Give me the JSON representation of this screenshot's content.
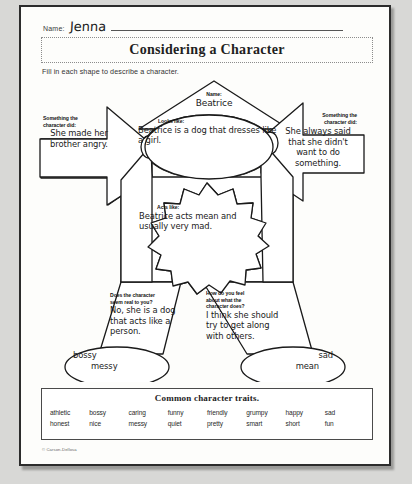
{
  "page": {
    "name_label": "Name:",
    "name_value": "Jenna",
    "title": "Considering a Character",
    "instruction": "Fill in each shape to describe a character.",
    "copyright": "© Carson-Dellosa"
  },
  "organizer": {
    "head": {
      "prompt": "Name:",
      "answer": "Beatrice"
    },
    "face": {
      "prompt": "Looks like:",
      "answer": "Beatrice is a dog that dresses like a girl."
    },
    "left_arm": {
      "prompt_line1": "Something the",
      "prompt_line2": "character did:",
      "answer": "She made her brother angry."
    },
    "right_arm": {
      "prompt_line1": "Something the",
      "prompt_line2": "character did:",
      "answer": "She always said that she didn't want to do something."
    },
    "torso": {
      "prompt": "Acts like:",
      "answer": "Beatrice acts mean and usually very mad."
    },
    "left_leg": {
      "prompt_line1": "Does the character",
      "prompt_line2": "seem real to you?",
      "answer": "No, she is a dog that acts like a person."
    },
    "right_leg": {
      "prompt_line1": "How do you feel",
      "prompt_line2": "about what the",
      "prompt_line3": "character does?",
      "answer": "I think she should try to get along with others."
    },
    "left_foot": {
      "trait_a": "bossy",
      "trait_b": "messy"
    },
    "right_foot": {
      "trait_a": "sad",
      "trait_b": "mean"
    }
  },
  "traits_box": {
    "title": "Common character traits.",
    "row1": [
      "athletic",
      "bossy",
      "caring",
      "funny",
      "friendly",
      "grumpy",
      "happy",
      "sad"
    ],
    "row2": [
      "honest",
      "nice",
      "messy",
      "quiet",
      "pretty",
      "smart",
      "short",
      "fun"
    ]
  },
  "colors": {
    "ink": "#1a1a1a",
    "paper": "#fdfdfb",
    "frame": "#2c2c2c",
    "backdrop": "#d8d8d6"
  }
}
